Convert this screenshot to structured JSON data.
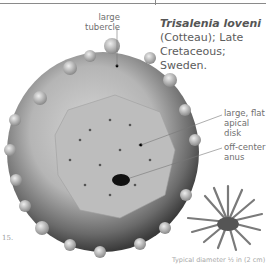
{
  "header": {
    "rule": true
  },
  "title": {
    "species": "Trisalenia loveni",
    "authority": "(Cotteau); Late",
    "period": "Cretaceous; Sweden."
  },
  "labels": {
    "tubercle": [
      "large",
      "tubercle"
    ],
    "apical_disk": [
      "large, flat",
      "apical disk"
    ],
    "anus": [
      "off-center",
      "anus"
    ]
  },
  "page_fragment": "15.",
  "caption": "Typical diameter ½ in (2 cm)",
  "colors": {
    "specimen_light": "#cfcfcf",
    "specimen_dark": "#3a3a3a",
    "text": "#6f6f6f"
  }
}
